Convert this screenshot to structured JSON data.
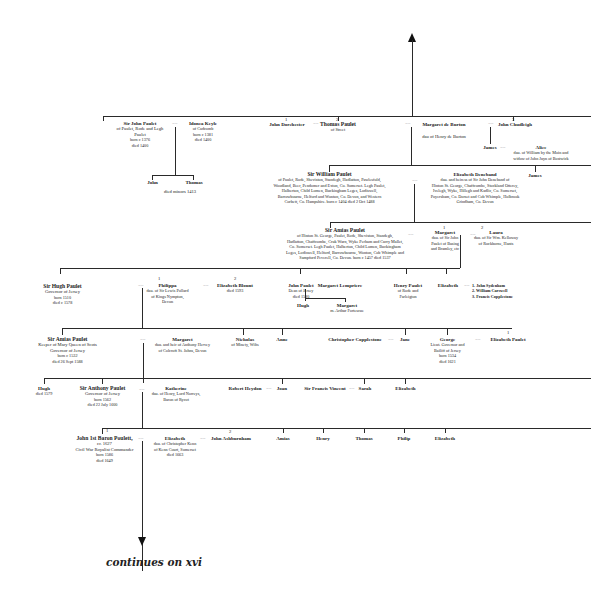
{
  "continues_label": "continues on xvi",
  "generation1": {
    "john": {
      "name": "Sir John Paulet",
      "line1": "of Paulet, Rode and Legh",
      "line2": "Paulet",
      "born": "born c 1376",
      "died": "died 1400"
    },
    "joanna": {
      "name": "Idonea Keyle",
      "line1": "of Cadcomb",
      "born": "born c 1381",
      "died": "died 1400"
    },
    "children": [
      {
        "name": "John"
      },
      {
        "name": "Thomas"
      }
    ],
    "children_note": "died minors 1413",
    "john_dorchester": {
      "num": "1",
      "name": "John Dorchester"
    },
    "thomas": {
      "num": "2",
      "name": "Thomas Paulet",
      "line1": "of Street"
    },
    "margaret": {
      "name": "Margaret de Burton",
      "line1": "dau of Henry de Burton"
    },
    "john_chudleigh": {
      "num": "3",
      "name": "John Chudleigh"
    },
    "james": {
      "name": "James"
    },
    "alice": {
      "name": "Alice",
      "line1": "dau. of William by the Moin and",
      "line2": "widow of John Juyn of Bostwick"
    }
  },
  "generation2": {
    "william": {
      "name": "Sir William Paulet",
      "desc": [
        "of Paulet, Rode, Sheviston, Standegh, Hadlatton, Pawlesfold,",
        "Woodland, Beer, Pendomer and Exton, Co. Somerset. Legh Paulet,",
        "Halberton, Child Lomen, Buckingham Leges, Lodiswell,",
        "Barrowbourne, Helford and Wonton, Co. Devon, and Western",
        "Corbett, Co. Hampshire. born c 1404 died 2 Oct 1488"
      ]
    },
    "elizabeth": {
      "name": "Elizabeth Deneband",
      "desc": [
        "dau. and heiress of Sir John Deneband of",
        "Hinton St. George, Chaffcombe, Stockland Otterey,",
        "Ivelegh, Wyke, Hillegh and Kadlic, Co. Somerset,",
        "Poyersham, Co. Dorset and Cob Whimple, Holbrook",
        "Grindham, Co. Devon"
      ]
    },
    "james": {
      "name": "James"
    }
  },
  "generation3": {
    "amias": {
      "name": "Sir Amias Paulet",
      "desc": [
        "of Hinton St. George, Paulet, Rode, Sheviston, Standegh,",
        "Hadlatton, Chaffcombe, Cruk Warn, Wyke Perham and Curry Mallet,",
        "Co. Somerset. Legh Paulet, Halberton, Child Lomen, Buckingham",
        "Leges, Lodiswell, Helford, Barrowbourne, Wonton, Cob Whimple and",
        "Sampford Peverell, Co. Devon. born c 1457 died 1537"
      ]
    },
    "margaret": {
      "num": "1",
      "name": "Margaret",
      "desc": [
        "dau. of Sir John",
        "Paulet of Basing",
        "and Bramley, etc"
      ]
    },
    "laura": {
      "num": "2",
      "name": "Laura",
      "desc": [
        "dau. of Sir Wm. Kelloway",
        "of Rockborne, Hants"
      ]
    }
  },
  "generation4": {
    "hugh": {
      "name": "Sir Hugh Paulet",
      "line1": "Governor of Jersey",
      "born": "born 1510",
      "died": "died c 1578"
    },
    "philippa": {
      "num": "1",
      "name": "Philippa",
      "desc": [
        "dau. of Sir Lewis Pollard",
        "of Kings Nympton,",
        "Devon"
      ]
    },
    "elizabeth_blount": {
      "num": "2",
      "name": "Elizabeth Blount",
      "died": "died 1593"
    },
    "john_paulet": {
      "name": "John Paulet",
      "line1": "Dean of Jersey",
      "died": "died 1580"
    },
    "margaret_lempriere": {
      "name": "Margaret Lempriere"
    },
    "hugh_child": {
      "name": "Hugh"
    },
    "margaret_child": {
      "name": "Margaret",
      "line1": "m. Arthur Fortescue"
    },
    "henry": {
      "name": "Henry Paulet",
      "desc": [
        "of Rode and",
        "Farleigton"
      ]
    },
    "elizabeth": {
      "name": "Elizabeth"
    },
    "husbands": [
      "1. John Sydenham",
      "2. William Carswell",
      "3. Francis Copplestone"
    ]
  },
  "generation5": {
    "amias": {
      "name": "Sir Amias Paulet",
      "line1": "Keeper of Mary Queen of Scots",
      "line2": "Governor of Jersey",
      "born": "born c 1532",
      "died": "died 26 Sept 1588"
    },
    "margaret": {
      "name": "Margaret",
      "desc": [
        "dau. and heir of Anthony Hervey",
        "of Colcroft St. Johns, Devon"
      ]
    },
    "nicholas": {
      "name": "Nicholas",
      "line1": "of Minety, Wilts"
    },
    "anne": {
      "name": "Anne"
    },
    "christopher": {
      "name": "Christopher Copplestone"
    },
    "jane": {
      "name": "Jane"
    },
    "george": {
      "name": "George",
      "desc": [
        "Lieut. Governor and",
        "Bailiff of Jersey",
        "born 1534",
        "died 1621"
      ]
    },
    "elizabeth_paulet": {
      "num": "1",
      "name": "Elizabeth Paulet"
    }
  },
  "generation6": {
    "hugh": {
      "name": "Hugh",
      "died": "died 1579"
    },
    "anthony": {
      "name": "Sir Anthony Paulet",
      "line1": "Governor of Jersey",
      "born": "born 1562",
      "died": "died 22 July 1600"
    },
    "katherine": {
      "name": "Katherine",
      "desc": [
        "dau. of Henry, Lord Norreys,",
        "Baron of Rycot"
      ]
    },
    "robert": {
      "name": "Robert Heydon"
    },
    "joan": {
      "name": "Joan"
    },
    "francis": {
      "name": "Sir Francis Vincent"
    },
    "sarah": {
      "name": "Sarah"
    },
    "elizabeth": {
      "name": "Elizabeth"
    }
  },
  "generation7": {
    "john": {
      "num": "1",
      "name": "John 1st Baron Poulett,",
      "line1": "cr. 1627",
      "line2": "Civil War Royalist Commander",
      "born": "born 1586",
      "died": "died 1649"
    },
    "elizabeth": {
      "name": "Elizabeth",
      "desc": [
        "dau. of Christopher Kenn",
        "of Kenn Court, Somerset"
      ],
      "died": "died 1663"
    },
    "john_ashburnham": {
      "num": "2",
      "name": "John Ashburnham"
    },
    "siblings": [
      {
        "name": "Amias"
      },
      {
        "name": "Henry"
      },
      {
        "name": "Thomas"
      },
      {
        "name": "Philip"
      },
      {
        "name": "Elizabeth"
      }
    ]
  }
}
